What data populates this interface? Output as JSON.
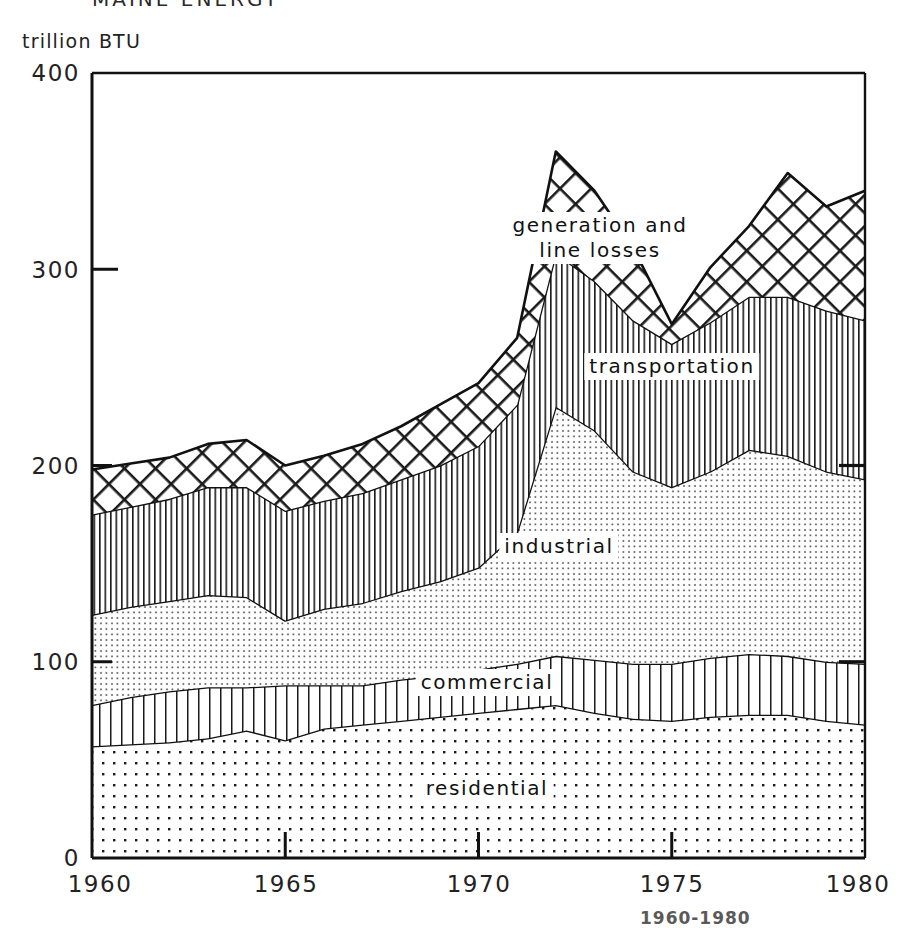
{
  "figure": {
    "title_partial": "MAINE  ENERGY",
    "footer_partial": "1960-1980",
    "axis_unit": "trillion BTU"
  },
  "axes": {
    "y_ticks": [
      "0",
      "100",
      "200",
      "300",
      "400"
    ],
    "y_values": [
      0,
      100,
      200,
      300,
      400
    ],
    "x_ticks": [
      "1960",
      "1965",
      "1970",
      "1975",
      "1980"
    ],
    "x_values": [
      1960,
      1965,
      1970,
      1975,
      1980
    ],
    "ylim": [
      0,
      400
    ],
    "xlim": [
      1960,
      1980
    ]
  },
  "series_labels": {
    "generation": "generation and\nline losses",
    "generation_line1": "generation and",
    "generation_line2": "line losses",
    "transportation": "transportation",
    "industrial": "industrial",
    "commercial": "commercial",
    "residential": "residential"
  },
  "colors": {
    "stroke": "#111111",
    "background": "#ffffff",
    "pattern_ink": "#1a1a1a"
  },
  "chart_data": {
    "type": "area",
    "title": "MAINE ENERGY",
    "subtitle": "1960-1980",
    "xlabel": "",
    "ylabel": "trillion BTU",
    "ylim": [
      0,
      400
    ],
    "xlim": [
      1960,
      1980
    ],
    "grid": false,
    "stacked": true,
    "legend": "inline-labels",
    "x": [
      1960,
      1961,
      1962,
      1963,
      1964,
      1965,
      1966,
      1967,
      1968,
      1969,
      1970,
      1971,
      1972,
      1973,
      1974,
      1975,
      1976,
      1977,
      1978,
      1979,
      1980
    ],
    "series": [
      {
        "name": "residential",
        "pattern": "dot-grid",
        "values": [
          57,
          58,
          59,
          61,
          65,
          60,
          66,
          68,
          70,
          72,
          74,
          76,
          78,
          74,
          71,
          70,
          72,
          73,
          73,
          70,
          68
        ]
      },
      {
        "name": "commercial",
        "pattern": "vertical-lines-wide",
        "values": [
          21,
          24,
          26,
          26,
          22,
          28,
          22,
          20,
          21,
          21,
          22,
          23,
          25,
          27,
          28,
          29,
          30,
          31,
          30,
          30,
          31
        ]
      },
      {
        "name": "industrial",
        "pattern": "fine-dots",
        "values": [
          46,
          46,
          46,
          47,
          46,
          33,
          39,
          42,
          45,
          48,
          52,
          67,
          127,
          117,
          98,
          90,
          95,
          104,
          102,
          97,
          94
        ]
      },
      {
        "name": "transportation",
        "pattern": "vertical-lines-narrow",
        "values": [
          51,
          51,
          52,
          55,
          56,
          56,
          55,
          56,
          57,
          59,
          62,
          65,
          78,
          76,
          77,
          73,
          76,
          78,
          81,
          82,
          81
        ]
      },
      {
        "name": "generation and line losses",
        "pattern": "cross-hatch",
        "values": [
          23,
          22,
          21,
          22,
          24,
          23,
          23,
          25,
          27,
          31,
          32,
          34,
          52,
          46,
          37,
          10,
          28,
          36,
          63,
          53,
          66
        ]
      }
    ],
    "totals": [
      198,
      201,
      204,
      211,
      213,
      200,
      205,
      211,
      220,
      231,
      242,
      265,
      360,
      340,
      311,
      272,
      301,
      322,
      349,
      332,
      340
    ]
  }
}
